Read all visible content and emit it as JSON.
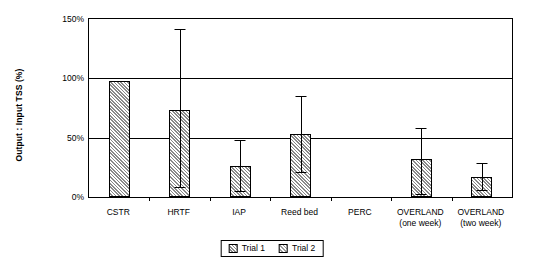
{
  "chart_data": {
    "type": "bar",
    "title": "",
    "xlabel": "",
    "ylabel": "Output : Input TSS (%)",
    "ylim": [
      0,
      150
    ],
    "ytick_labels": [
      "0%",
      "50%",
      "100%",
      "150%"
    ],
    "ytick_values": [
      0,
      50,
      100,
      150
    ],
    "grid": true,
    "legend_position": "bottom",
    "categories": [
      "CSTR",
      "HRTF",
      "IAP",
      "Reed bed",
      "PERC",
      "OVERLAND\n(one week)",
      "OVERLAND\n(two week)"
    ],
    "category_lines": [
      [
        "CSTR"
      ],
      [
        "HRTF"
      ],
      [
        "IAP"
      ],
      [
        "Reed bed"
      ],
      [
        "PERC"
      ],
      [
        "OVERLAND",
        "(one week)"
      ],
      [
        "OVERLAND",
        "(two week)"
      ]
    ],
    "series": [
      {
        "name": "Trial 1",
        "values": [
          null,
          null,
          null,
          null,
          null,
          null,
          null
        ]
      },
      {
        "name": "Trial 2",
        "values": [
          98,
          73,
          26,
          53,
          null,
          32,
          17
        ],
        "errors_upper": [
          0,
          68,
          21,
          31,
          null,
          25,
          11
        ],
        "errors_lower": [
          0,
          65,
          22,
          33,
          null,
          30,
          12
        ]
      }
    ],
    "legend_entries": [
      "Trial 1",
      "Trial 2"
    ]
  }
}
